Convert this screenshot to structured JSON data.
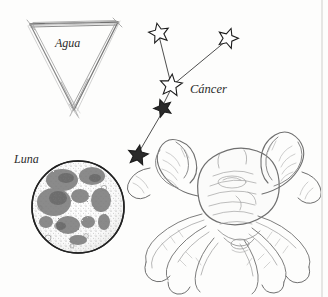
{
  "plate": {
    "title": "Cáncer astrological plate",
    "background_color": "#fdfdfc",
    "ink_color": "#6b6b6b",
    "label_color": "#2b2b2b"
  },
  "labels": {
    "element": "Agua",
    "sign": "Cáncer",
    "luminary": "Luna"
  },
  "element_symbol": {
    "name": "water-triangle",
    "shape": "inverted-triangle",
    "points": [
      [
        30,
        24
      ],
      [
        118,
        22
      ],
      [
        74,
        108
      ]
    ]
  },
  "moon": {
    "name": "moon-disc",
    "center": [
      78,
      207
    ],
    "radius": 46,
    "texture": "stippled-maria"
  },
  "constellation": {
    "name": "cancer",
    "stars": [
      {
        "id": "star-1",
        "x": 159,
        "y": 33,
        "size": 9
      },
      {
        "id": "star-2",
        "x": 228,
        "y": 38,
        "size": 9
      },
      {
        "id": "star-3",
        "x": 171,
        "y": 86,
        "size": 10
      },
      {
        "id": "star-4",
        "x": 163,
        "y": 108,
        "size": 8
      },
      {
        "id": "star-5",
        "x": 138,
        "y": 155,
        "size": 9
      }
    ],
    "lines": [
      [
        "star-1",
        "star-3"
      ],
      [
        "star-2",
        "star-3"
      ],
      [
        "star-3",
        "star-4"
      ],
      [
        "star-4",
        "star-5"
      ]
    ]
  },
  "crab": {
    "name": "crab-engraving",
    "parts": [
      "carapace",
      "left-claw",
      "right-claw",
      "walking-legs"
    ]
  }
}
